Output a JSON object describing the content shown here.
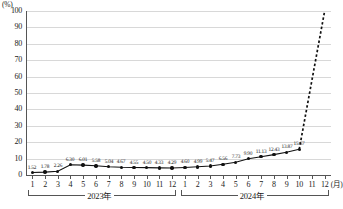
{
  "chart_data": {
    "type": "line",
    "title": "",
    "xlabel": "(月)",
    "ylabel": "(%)",
    "ylim": [
      0,
      100
    ],
    "yticks": [
      100,
      90,
      80,
      70,
      60,
      50,
      40,
      30,
      20,
      10,
      0
    ],
    "grid": true,
    "legend": "none",
    "x_groups": [
      {
        "label": "2023年",
        "months": [
          "1",
          "2",
          "3",
          "4",
          "5",
          "6",
          "7",
          "8",
          "9",
          "10",
          "11",
          "12"
        ]
      },
      {
        "label": "2024年",
        "months": [
          "1",
          "2",
          "3",
          "4",
          "5",
          "6",
          "7",
          "8",
          "9",
          "10",
          "11",
          "12"
        ]
      }
    ],
    "categories": [
      "2023-1",
      "2023-2",
      "2023-3",
      "2023-4",
      "2023-5",
      "2023-6",
      "2023-7",
      "2023-8",
      "2023-9",
      "2023-10",
      "2023-11",
      "2023-12",
      "2024-1",
      "2024-2",
      "2024-3",
      "2024-4",
      "2024-5",
      "2024-6",
      "2024-7",
      "2024-8",
      "2024-9",
      "2024-10",
      "2024-11",
      "2024-12"
    ],
    "series": [
      {
        "name": "実績",
        "style": "solid-with-markers",
        "values": [
          1.52,
          1.78,
          2.26,
          6.3,
          6.01,
          5.58,
          5.04,
          4.67,
          4.55,
          4.5,
          4.33,
          4.29,
          4.6,
          4.99,
          5.47,
          6.56,
          7.73,
          9.9,
          11.13,
          12.43,
          13.87,
          15.67,
          null,
          null
        ],
        "labels": [
          "1.52",
          "1.78",
          "2.26",
          "6.30",
          "6.01",
          "5.58",
          "5.04",
          "4.67",
          "4.55",
          "4.50",
          "4.33",
          "4.29",
          "4.60",
          "4.99",
          "5.47",
          "6.56",
          "7.73",
          "9.90",
          "11.13",
          "12.43",
          "13.87",
          "15.67",
          "",
          ""
        ]
      },
      {
        "name": "見通し",
        "style": "dashed",
        "from": {
          "category": "2024-10",
          "value": 15.67
        },
        "to": {
          "category": "2024-12",
          "value": 100
        }
      }
    ]
  },
  "axis": {
    "unit_top": "(%)",
    "unit_right": "(月)"
  }
}
